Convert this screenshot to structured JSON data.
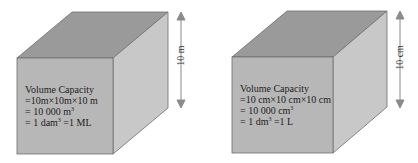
{
  "cubes": [
    {
      "dimension_label": "10  m",
      "lines": {
        "title": "Volume Capacity",
        "line1": "=10m×10m×10  m",
        "line2_prefix": "=  10 000  m",
        "line2_sup": "3",
        "line3_prefix": "=  1 dam",
        "line3_sup": "3",
        "line3_suffix": " =1 ML"
      }
    },
    {
      "dimension_label": "10 cm",
      "lines": {
        "title": "Volume Capacity",
        "line1": "=10 cm×10 cm×10 cm",
        "line2_prefix": "=  10 000   cm",
        "line2_sup": "3",
        "line3_prefix": "=  1 dm",
        "line3_sup": "3",
        "line3_suffix": " =1 L"
      }
    }
  ],
  "colors": {
    "front": "#b7b7b7",
    "top": "#9a9a9a",
    "side": "#c8c8c8",
    "edge": "#6e6e6e",
    "arrow": "#8a8a8a"
  }
}
